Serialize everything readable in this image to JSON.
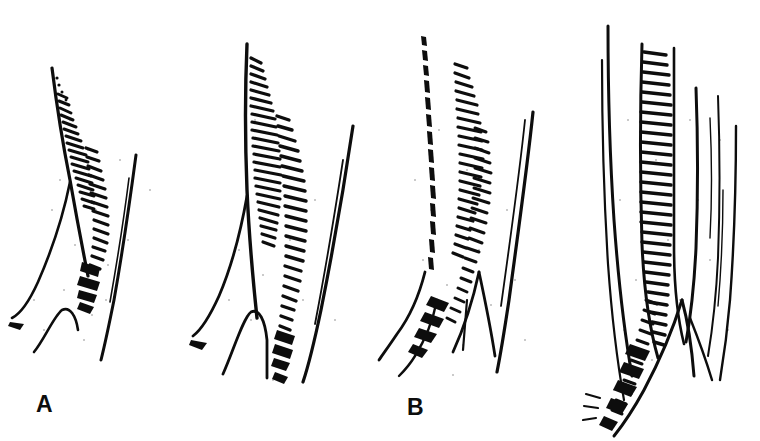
{
  "figure": {
    "background_color": "#ffffff",
    "ink_color": "#0d0d0d",
    "width": 760,
    "height": 441,
    "panel_count": 4
  },
  "panels": [
    {
      "id": "a",
      "label": "A",
      "label_x": 36,
      "label_y": 393,
      "subject": "smallest stage: short curved ligule with sparse cilia on a slender sheath",
      "cilia_rows": 2,
      "cilia_count_primary": 17,
      "cilia_count_secondary": 14,
      "stem_lines": 3,
      "art_top": 64,
      "art_bottom": 360
    },
    {
      "id": "b",
      "label": "B",
      "label_x": 222,
      "label_y": 396,
      "subject": "second stage: elongated ligule with dense regular comb of cilia",
      "cilia_rows": 2,
      "cilia_count_primary": 24,
      "cilia_count_secondary": 22,
      "stem_lines": 4,
      "art_top": 40,
      "art_bottom": 378
    },
    {
      "id": "c",
      "label": "C",
      "label_x": 438,
      "label_y": 395,
      "subject": "third stage: upright ligule with branching node at the base",
      "cilia_rows": 2,
      "cilia_count_primary": 22,
      "cilia_count_secondary": 20,
      "stem_lines": 5,
      "art_top": 30,
      "art_bottom": 372
    },
    {
      "id": "d",
      "label": "D",
      "label_x": 668,
      "label_y": 396,
      "subject": "largest stage: long ladder-like rachis with dense transverse bars and V-shaped branch node",
      "cilia_rows": 2,
      "cilia_count_primary": 30,
      "cilia_count_secondary": 26,
      "stem_lines": 5,
      "art_top": 26,
      "art_bottom": 420
    }
  ]
}
